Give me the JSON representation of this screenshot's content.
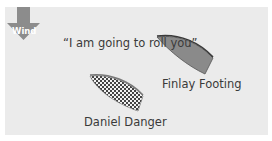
{
  "wind": {
    "label": "Wind",
    "direction": "down",
    "color": "#8c8c8c"
  },
  "quote": "“I am going to roll you”",
  "boats": [
    {
      "name": "Finlay Footing",
      "fill": "solid-gray",
      "color": "#8a8a8a"
    },
    {
      "name": "Daniel Danger",
      "fill": "checkered",
      "color": "#555555"
    }
  ],
  "colors": {
    "background": "#ebebeb",
    "text": "#3a3a3a"
  }
}
